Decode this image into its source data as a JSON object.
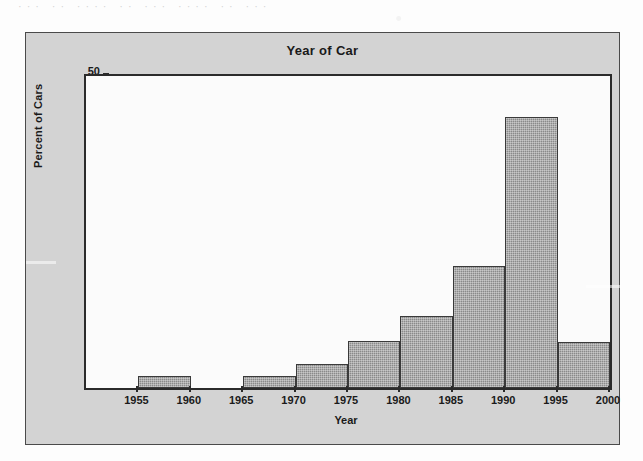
{
  "page": {
    "background_color": "#fdfdfd",
    "top_bleed_text": "···  ··  ····  ··  ···  ····  ··  ···"
  },
  "chart": {
    "panel_color": "#d3d3d3",
    "plot_background": "#fbfbfb",
    "bar_color": "#8a8a8a",
    "axis_color": "#2b2b2b",
    "title": "Year of Car",
    "x_axis_title": "Year",
    "y_axis_title": "Percent of Cars"
  },
  "chart_data": {
    "type": "bar",
    "title": "Year of Car",
    "xlabel": "Year",
    "ylabel": "Percent of Cars",
    "xlim": [
      1950,
      2000
    ],
    "ylim": [
      0,
      50
    ],
    "grid": false,
    "legend": false,
    "bin_width": 5,
    "x_ticks": [
      1955,
      1960,
      1965,
      1970,
      1975,
      1980,
      1985,
      1990,
      1995,
      2000
    ],
    "y_ticks": [
      0,
      10,
      20,
      30,
      40,
      50
    ],
    "bins": [
      {
        "label": "1950-1955",
        "start": 1950,
        "end": 1955,
        "value": 0
      },
      {
        "label": "1955-1960",
        "start": 1955,
        "end": 1960,
        "value": 2
      },
      {
        "label": "1960-1965",
        "start": 1960,
        "end": 1965,
        "value": 0
      },
      {
        "label": "1965-1970",
        "start": 1965,
        "end": 1970,
        "value": 2
      },
      {
        "label": "1970-1975",
        "start": 1970,
        "end": 1975,
        "value": 3.8
      },
      {
        "label": "1975-1980",
        "start": 1975,
        "end": 1980,
        "value": 7.6
      },
      {
        "label": "1980-1985",
        "start": 1980,
        "end": 1985,
        "value": 11.5
      },
      {
        "label": "1985-1990",
        "start": 1985,
        "end": 1990,
        "value": 19.5
      },
      {
        "label": "1990-1995",
        "start": 1990,
        "end": 1995,
        "value": 43.5
      },
      {
        "label": "1995-2000",
        "start": 1995,
        "end": 2000,
        "value": 7.4
      }
    ]
  }
}
